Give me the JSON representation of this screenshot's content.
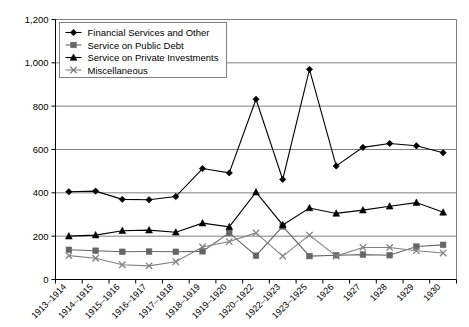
{
  "chart_data": {
    "type": "line",
    "title": "",
    "xlabel": "",
    "ylabel": "",
    "ylim": [
      0,
      1200
    ],
    "ytick_step": 200,
    "grid": true,
    "legend_position": "top-left",
    "categories": [
      "1913–1914",
      "1914–1915",
      "1915–1916",
      "1916–1917",
      "1917–1918",
      "1918–1919",
      "1919–1920",
      "1920–1922",
      "1922–1923",
      "1923–1925",
      "1926",
      "1927",
      "1928",
      "1929",
      "1930"
    ],
    "ytick_labels": [
      "0",
      "200",
      "400",
      "600",
      "800",
      "1,000",
      "1,200"
    ],
    "ytick_values": [
      0,
      200,
      400,
      600,
      800,
      1000,
      1200
    ],
    "series": [
      {
        "name": "Financial Services and Other",
        "marker": "diamond",
        "color": "#000000",
        "values": [
          405,
          408,
          370,
          368,
          383,
          512,
          492,
          832,
          462,
          970,
          524,
          610,
          628,
          617,
          585
        ]
      },
      {
        "name": "Service on Public Debt",
        "marker": "square",
        "color": "#666666",
        "values": [
          137,
          133,
          128,
          129,
          128,
          130,
          215,
          110,
          245,
          108,
          112,
          115,
          112,
          152,
          160
        ]
      },
      {
        "name": "Service on Private Investments",
        "marker": "triangle",
        "color": "#000000",
        "values": [
          200,
          205,
          225,
          228,
          218,
          260,
          243,
          403,
          252,
          330,
          305,
          320,
          338,
          355,
          310
        ]
      },
      {
        "name": "Miscellaneous",
        "marker": "cross",
        "color": "#808080",
        "values": [
          110,
          98,
          68,
          63,
          82,
          150,
          175,
          215,
          108,
          205,
          108,
          148,
          148,
          133,
          122
        ]
      }
    ]
  },
  "legend": {
    "items": [
      {
        "label": "Financial Services and Other"
      },
      {
        "label": "Service on Public Debt"
      },
      {
        "label": "Service on Private Investments"
      },
      {
        "label": "Miscellaneous"
      }
    ]
  }
}
